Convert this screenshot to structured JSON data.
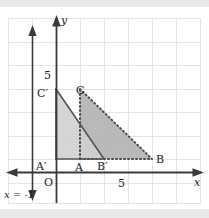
{
  "figure": {
    "background_color": "#ffffff",
    "band_color": "#e9e9e9",
    "grid_color": "#dfe6ea",
    "axis_color": "#3a3a3a",
    "shape_stroke_color": "#4a4a4a",
    "fill_light": "#d8d8d8",
    "fill_dark": "#b5b5b5"
  },
  "axes": {
    "x_axis_label": "x",
    "y_axis_label": "y",
    "origin_label": "O",
    "x_tick_label": "5",
    "y_tick_label": "5",
    "x_tick_value": 5,
    "y_tick_value": 5
  },
  "mirror_line": {
    "label": "x = -1",
    "equation": "x = -1",
    "x_value": -1,
    "style": "solid double-arrow"
  },
  "shapes": [
    {
      "name": "triangle-ABC",
      "vertices": [
        {
          "label": "A",
          "x": 1,
          "y": 0
        },
        {
          "label": "B",
          "x": 6,
          "y": 0
        },
        {
          "label": "C",
          "x": 1,
          "y": 5
        }
      ],
      "line_style": "dotted",
      "fill": "#b5b5b5",
      "role": "pre-image"
    },
    {
      "name": "triangle-A-prime-B-prime-C-prime",
      "vertices": [
        {
          "label": "A'",
          "x": -1,
          "y": 0
        },
        {
          "label": "B'",
          "x": 2,
          "y": 0
        },
        {
          "label": "C'",
          "x": -1,
          "y": 5
        }
      ],
      "line_style": "solid",
      "fill": "#d8d8d8",
      "role": "image"
    }
  ],
  "point_labels": {
    "A": "A",
    "B": "B",
    "C": "C",
    "A_prime": "A′",
    "B_prime": "B′",
    "C_prime": "C′"
  }
}
